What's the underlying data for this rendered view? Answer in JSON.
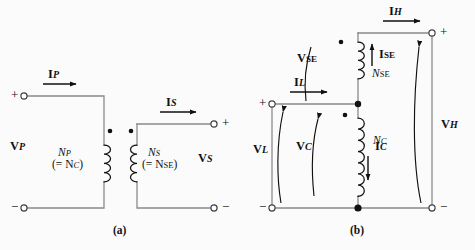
{
  "figure": {
    "background_color": "#fbfbfc",
    "wire_color": "#8a8a8a",
    "ink_color": "#111111",
    "captions": {
      "panel_a": "(a)",
      "panel_b": "(b)"
    }
  },
  "panel_a": {
    "name": "two-winding-transformer",
    "primary": {
      "current_label": "I",
      "current_sub": "P",
      "voltage_label": "V",
      "voltage_sub": "P",
      "turns_label": "N",
      "turns_sub": "P",
      "turns_equiv": "(= N",
      "turns_equiv_sub": "C",
      "turns_equiv_close": ")",
      "terminal_plus": "+",
      "terminal_minus": "−"
    },
    "secondary": {
      "current_label": "I",
      "current_sub": "S",
      "voltage_label": "V",
      "voltage_sub": "S",
      "turns_label": "N",
      "turns_sub": "S",
      "turns_equiv": "(= N",
      "turns_equiv_sub": "SE",
      "turns_equiv_close": ")",
      "terminal_plus": "+",
      "terminal_minus": "−"
    }
  },
  "panel_b": {
    "name": "autotransformer",
    "series_winding": {
      "current_label": "I",
      "current_sub": "SE",
      "voltage_label": "V",
      "voltage_sub": "SE",
      "turns_label": "N",
      "turns_sub": "SE"
    },
    "common_winding": {
      "current_label": "I",
      "current_sub": "C",
      "voltage_label": "V",
      "voltage_sub": "C",
      "turns_label": "N",
      "turns_sub": "C"
    },
    "low_side": {
      "current_label": "I",
      "current_sub": "L",
      "voltage_label": "V",
      "voltage_sub": "L",
      "terminal_plus": "+",
      "terminal_minus": "−"
    },
    "high_side": {
      "current_label": "I",
      "current_sub": "H",
      "voltage_label": "V",
      "voltage_sub": "H",
      "terminal_plus": "+",
      "terminal_minus": "−"
    }
  }
}
